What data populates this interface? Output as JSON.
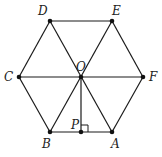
{
  "diagram": {
    "type": "regular hexagon with center",
    "points": [
      {
        "id": "D",
        "label": "D"
      },
      {
        "id": "E",
        "label": "E"
      },
      {
        "id": "C",
        "label": "C"
      },
      {
        "id": "O",
        "label": "O"
      },
      {
        "id": "F",
        "label": "F"
      },
      {
        "id": "B",
        "label": "B"
      },
      {
        "id": "P",
        "label": "P"
      },
      {
        "id": "A",
        "label": "A"
      }
    ],
    "segments": [
      [
        "D",
        "E"
      ],
      [
        "E",
        "F"
      ],
      [
        "F",
        "A"
      ],
      [
        "A",
        "B"
      ],
      [
        "B",
        "C"
      ],
      [
        "C",
        "D"
      ],
      [
        "C",
        "F"
      ],
      [
        "D",
        "A"
      ],
      [
        "E",
        "B"
      ],
      [
        "O",
        "P"
      ]
    ],
    "annotations": [
      "right angle at P (OP ⊥ AB)"
    ]
  }
}
